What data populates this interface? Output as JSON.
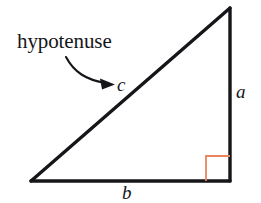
{
  "figure": {
    "kind": "right-triangle-diagram",
    "background_color": "#ffffff",
    "stroke_color": "#16161a",
    "right_angle_color": "#e8855e",
    "labels": {
      "hypotenuse_text": "hypotenuse",
      "side_c": "c",
      "side_a": "a",
      "side_b": "b"
    },
    "geometry": {
      "apex": [
        230,
        8
      ],
      "bottom_left": [
        31,
        181
      ],
      "bottom_right": [
        230,
        181
      ],
      "right_angle_marker_size": 24,
      "line_width": 3.2
    },
    "annotation_arrow": {
      "name": "hypotenuse-pointer-arrow",
      "start": [
        66,
        57
      ],
      "end": [
        113,
        84
      ]
    }
  }
}
